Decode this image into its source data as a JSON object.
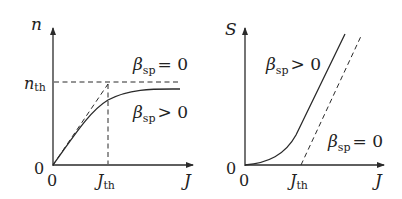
{
  "left_plot": {
    "y_axis_label": "n",
    "x_axis_label": "J",
    "origin_y_label": "0",
    "origin_x_label": "0",
    "threshold_y_label": {
      "main": "n",
      "sub": "th"
    },
    "threshold_x_label": {
      "main": "J",
      "sub": "th"
    },
    "curve_label_ideal": {
      "main": "β",
      "sub": "sp",
      "rel": "= 0"
    },
    "curve_label_real": {
      "main": "β",
      "sub": "sp",
      "rel": "> 0"
    }
  },
  "right_plot": {
    "y_axis_label": "S",
    "x_axis_label": "J",
    "origin_y_label": "0",
    "origin_x_label": "0",
    "threshold_x_label": {
      "main": "J",
      "sub": "th"
    },
    "curve_label_real": {
      "main": "β",
      "sub": "sp",
      "rel": "> 0"
    },
    "curve_label_ideal": {
      "main": "β",
      "sub": "sp",
      "rel": "= 0"
    }
  },
  "colors": {
    "line": "#2a2a2a",
    "background": "#ffffff"
  }
}
